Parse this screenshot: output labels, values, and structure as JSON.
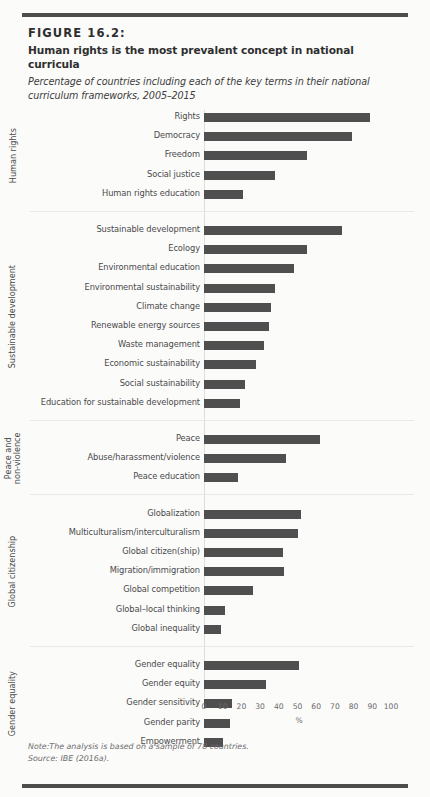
{
  "figure": {
    "number": "FIGURE 16.2:",
    "title": "Human rights is the most prevalent concept in national curricula",
    "subtitle": "Percentage of countries including each of the key terms in their national curriculum frameworks, 2005–2015",
    "note": "Note:The analysis is based on a sample of 78 countries.",
    "source": "Source: IBE (2016a)."
  },
  "colors": {
    "bar": "#4f4f4f",
    "rule": "#4d4d4d",
    "text": "#4a4a4a",
    "background": "#fbfbfa",
    "gridline": "#dedddb"
  },
  "chart_data": {
    "type": "bar",
    "orientation": "horizontal",
    "title": "Human rights is the most prevalent concept in national curricula",
    "subtitle": "Percentage of countries including each of the key terms in their national curriculum frameworks, 2005–2015",
    "xlabel": "%",
    "ylabel": "",
    "xlim": [
      0,
      100
    ],
    "xticks": [
      0,
      10,
      20,
      30,
      40,
      50,
      60,
      70,
      80,
      90,
      100
    ],
    "grid": false,
    "legend": "none",
    "groups": [
      {
        "name": "Human rights",
        "categories": [
          "Rights",
          "Democracy",
          "Freedom",
          "Social justice",
          "Human rights education"
        ],
        "values": [
          89,
          79,
          55,
          38,
          21
        ]
      },
      {
        "name": "Sustainable development",
        "categories": [
          "Sustainable development",
          "Ecology",
          "Environmental education",
          "Environmental sustainability",
          "Climate change",
          "Renewable energy sources",
          "Waste management",
          "Economic sustainability",
          "Social sustainability",
          "Education for sustainable development"
        ],
        "values": [
          74,
          55,
          48,
          38,
          36,
          35,
          32,
          28,
          22,
          19
        ]
      },
      {
        "name": "Peace and non-violence",
        "categories": [
          "Peace",
          "Abuse/harassment/violence",
          "Peace education"
        ],
        "values": [
          62,
          44,
          18
        ]
      },
      {
        "name": "Global citizenship",
        "categories": [
          "Globalization",
          "Multiculturalism/interculturalism",
          "Global citizen(ship)",
          "Migration/immigration",
          "Global competition",
          "Global–local thinking",
          "Global inequality"
        ],
        "values": [
          52,
          50,
          42,
          43,
          26,
          11,
          9
        ]
      },
      {
        "name": "Gender equality",
        "categories": [
          "Gender equality",
          "Gender equity",
          "Gender sensitivity",
          "Gender parity",
          "Empowerment"
        ],
        "values": [
          51,
          33,
          15,
          14,
          10
        ]
      }
    ]
  }
}
